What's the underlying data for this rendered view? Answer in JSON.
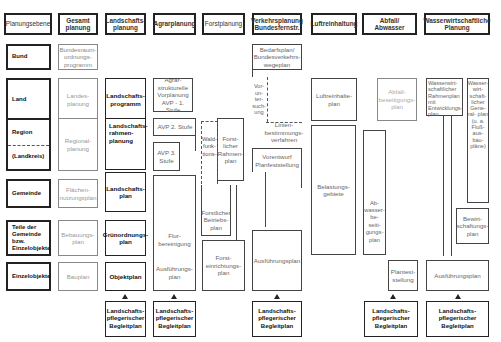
{
  "headers": [
    {
      "id": "planungsebene",
      "label": "Planungsebene"
    },
    {
      "id": "gesamt",
      "label": "Gesamt planung"
    },
    {
      "id": "landschaft",
      "label": "Landschafts- planung"
    },
    {
      "id": "agrar",
      "label": "Agrarplanung"
    },
    {
      "id": "forst",
      "label": "Forstplanung"
    },
    {
      "id": "verkehr",
      "label": "Verkehrsplanung Bundesfernstr."
    },
    {
      "id": "luft",
      "label": "Luftreinhaltung"
    },
    {
      "id": "abfall",
      "label": "Abfall/ Abwasser"
    },
    {
      "id": "wasser",
      "label": "Wasserwirtschaftliche Planung"
    }
  ],
  "levels": [
    {
      "id": "bund",
      "label": "Bund"
    },
    {
      "id": "land",
      "label": "Land"
    },
    {
      "id": "region",
      "label": "Region"
    },
    {
      "id": "landkreis",
      "label": "(Landkreis)"
    },
    {
      "id": "gemeinde",
      "label": "Gemeinde"
    },
    {
      "id": "teile",
      "label": "Teile der Gemeinde bzw. Einzelobjekte"
    },
    {
      "id": "einzel",
      "label": "Einzelobjekte"
    }
  ],
  "gesamt": {
    "bund": "Bundesraum- ordnungs- programm",
    "land": "Landes- planung",
    "region": "Regional- planung",
    "gemeinde": "Flächen- nutzungsplan",
    "teile": "Bebauungs- plan",
    "einzel": "Bauplan"
  },
  "landschaft": {
    "land": "Landschafts- programm",
    "region": "Landschafts- rahmen- planung",
    "gemeinde": "Landschafts- plan",
    "teile": "Grünordnungs- plan",
    "einzel": "Objektplan"
  },
  "agrar": {
    "land": "Agrar- strukturelle Vorplanung AVP - 1. Stufe",
    "avp2": "AVP 2. Stufe",
    "avp3": "AVP 3. Stufe",
    "flur": "Flur- bereinigung",
    "ausf": "Ausführungs- plan"
  },
  "forst": {
    "rahmen": "Forst- licher Rahmen- plan",
    "wald1": "Wald- funk- tions-",
    "wald2": "kartie- rung",
    "betrieb": "Forstlicher Betriebs- plan",
    "einricht": "Forst- einrichtungs- plan"
  },
  "verkehr": {
    "bedarf": "Bedarfsplan/ Bundesverkehrs- wegeplan",
    "vorunt": "Vor- un- ter- such- ung",
    "linien": "Linien- bestimmungs- verfahren",
    "vorentwurf": "Vorentwurf Planfeststellung",
    "ausf": "Ausführungsplan"
  },
  "luft": {
    "luftplan": "Luftreinhalte- plan",
    "belast": "Belastungs- gebiete"
  },
  "abfall": {
    "abfallplan": "Abfall- beseitigungs- plan",
    "abwasser": "Ab- wasser- be- seiti- gungs- plan",
    "plan": "Plantest- stellung"
  },
  "wasser": {
    "rahmen": "Wasserwirt- schaftlicher Rahmenplan mit Entwicklungs- plan",
    "general": "Wasser- wirt- schaft- licher Gene- ral- plan (u. a. Fluß- aus- bau- pläne)",
    "bewirt": "Bewirt- schaftungs- plan",
    "ausf": "Ausführungsplan"
  },
  "begleitplan_label": "Landschafts- pflegerischer Begleitplan"
}
